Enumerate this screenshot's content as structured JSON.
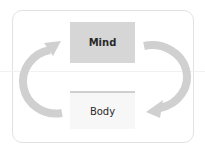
{
  "diagram": {
    "type": "cycle",
    "nodes": [
      {
        "id": "mind",
        "label": "Mind"
      },
      {
        "id": "body",
        "label": "Body"
      }
    ],
    "edges": [
      {
        "from": "mind",
        "to": "body",
        "side": "right",
        "direction": "clockwise"
      },
      {
        "from": "body",
        "to": "mind",
        "side": "left",
        "direction": "clockwise"
      }
    ],
    "colors": {
      "arrow": "#d0d0d0",
      "mind_fill": "#d6d6d6",
      "body_fill": "#f7f7f7",
      "body_top_border": "#cfcfcf",
      "frame_border": "#e2e2e2"
    }
  }
}
